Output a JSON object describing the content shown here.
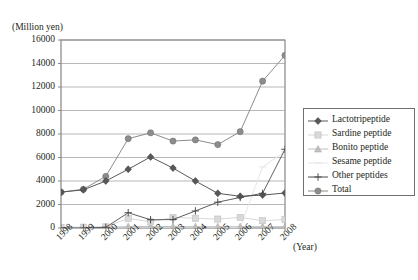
{
  "chart_data": {
    "type": "line",
    "title": "",
    "ylabel": "(Million yen)",
    "xlabel": "(Year)",
    "grid": true,
    "legend_position": "right",
    "ylim": [
      0,
      16000
    ],
    "ytick_labels": [
      "0",
      "2000",
      "4000",
      "6000",
      "8000",
      "10000",
      "12000",
      "14000",
      "16000"
    ],
    "ytick_values": [
      0,
      2000,
      4000,
      6000,
      8000,
      10000,
      12000,
      14000,
      16000
    ],
    "categories": [
      "1998",
      "1999",
      "2000",
      "2001",
      "2002",
      "2003",
      "2004",
      "2005",
      "2006",
      "2007",
      "2008"
    ],
    "series": [
      {
        "name": "Lactotripeptide",
        "color": "#58585b",
        "marker": "diamond",
        "values": [
          3050,
          3250,
          4000,
          5000,
          6050,
          5100,
          4000,
          2950,
          2700,
          2800,
          2980
        ]
      },
      {
        "name": "Sardine peptide",
        "color": "#d9d9d9",
        "marker": "square",
        "values": [
          60,
          70,
          90,
          820,
          520,
          900,
          830,
          760,
          900,
          620,
          720
        ]
      },
      {
        "name": "Bonito peptide",
        "color": "#bfbfbf",
        "marker": "triangle",
        "values": [
          40,
          50,
          60,
          120,
          130,
          120,
          110,
          110,
          110,
          110,
          110
        ]
      },
      {
        "name": "Sesame peptide",
        "color": "#e6e6e6",
        "marker": "line",
        "values": [
          0,
          0,
          0,
          0,
          0,
          0,
          0,
          0,
          60,
          5200,
          6500
        ]
      },
      {
        "name": "Other peptides",
        "color": "#4d4d4d",
        "marker": "plus",
        "values": [
          0,
          0,
          60,
          1300,
          700,
          720,
          1450,
          2200,
          2600,
          2950,
          6700
        ]
      },
      {
        "name": "Total",
        "color": "#8c8c8c",
        "marker": "circle",
        "values": [
          3050,
          3300,
          4400,
          7600,
          8100,
          7400,
          7500,
          7100,
          8200,
          12500,
          14700
        ]
      }
    ]
  },
  "axes": {
    "ylabel": "(Million yen)",
    "xlabel": "(Year)"
  }
}
